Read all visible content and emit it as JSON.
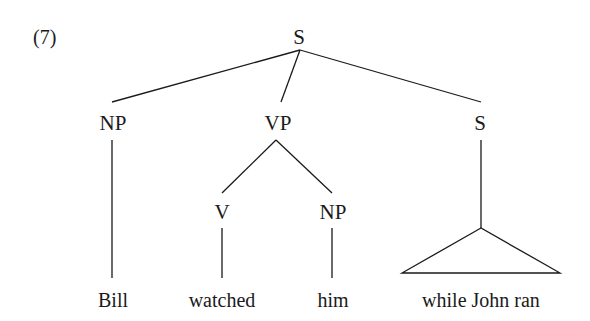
{
  "example_number": "(7)",
  "tree": {
    "root": "S",
    "nodes": {
      "np_subject": "NP",
      "vp": "VP",
      "s_adjunct": "S",
      "v": "V",
      "np_object": "NP"
    },
    "leaves": {
      "bill": "Bill",
      "watched": "watched",
      "him": "him",
      "while_clause": "while John ran"
    },
    "structure": "[S [NP Bill] [VP [V watched] [NP him]] [S while John ran]]",
    "note": "S adjunct drawn with triangle (unanalyzed constituent)"
  }
}
